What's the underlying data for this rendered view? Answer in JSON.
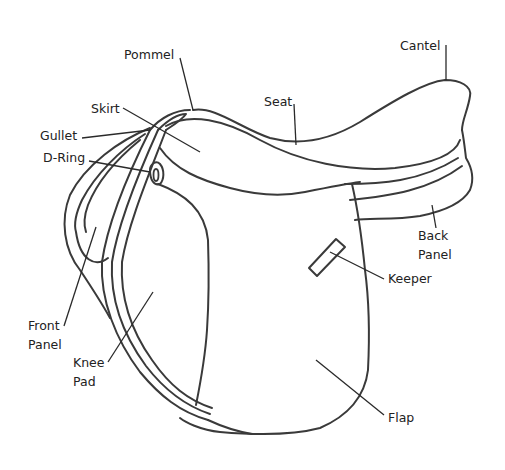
{
  "diagram": {
    "line_color": "#3a3a3a",
    "text_color": "#222222",
    "labels": [
      {
        "id": "pommel",
        "text": "Pommel",
        "x": 124,
        "y": 45,
        "line": [
          180,
          58,
          193,
          110
        ]
      },
      {
        "id": "skirt",
        "text": "Skirt",
        "x": 91,
        "y": 99,
        "line": [
          123,
          108,
          200,
          152
        ]
      },
      {
        "id": "gullet",
        "text": "Gullet",
        "x": 40,
        "y": 126,
        "line": [
          82,
          138,
          150,
          130
        ]
      },
      {
        "id": "d-ring",
        "text": "D-Ring",
        "x": 43,
        "y": 148,
        "line": [
          89,
          161,
          150,
          172
        ]
      },
      {
        "id": "seat",
        "text": "Seat",
        "x": 264,
        "y": 92,
        "line": [
          294,
          104,
          296,
          145
        ]
      },
      {
        "id": "cantel",
        "text": "Cantel",
        "x": 400,
        "y": 36,
        "line": [
          446,
          45,
          446,
          80
        ]
      },
      {
        "id": "back-panel",
        "text": "Back\nPanel",
        "x": 418,
        "y": 226,
        "line": [
          432,
          205,
          436,
          228
        ]
      },
      {
        "id": "keeper",
        "text": "Keeper",
        "x": 388,
        "y": 269,
        "line": [
          330,
          252,
          384,
          279
        ]
      },
      {
        "id": "front-panel",
        "text": "Front\nPanel",
        "x": 28,
        "y": 316,
        "line": [
          96,
          227,
          64,
          326
        ]
      },
      {
        "id": "knee-pad",
        "text": "Knee\nPad",
        "x": 73,
        "y": 353,
        "line": [
          153,
          292,
          108,
          362
        ]
      },
      {
        "id": "flap",
        "text": "Flap",
        "x": 388,
        "y": 408,
        "line": [
          316,
          360,
          384,
          415
        ]
      }
    ]
  }
}
